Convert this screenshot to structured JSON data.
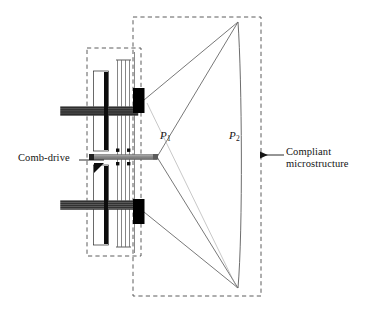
{
  "figure": {
    "background": "#ffffff",
    "width": 366,
    "height": 313
  },
  "labels": {
    "comb_drive": "Comb-drive",
    "compliant_line1": "Compliant",
    "compliant_line2": "microstructure",
    "point_p1": "P",
    "point_p1_sub": "1",
    "point_p2": "P",
    "point_p2_sub": "2"
  },
  "colors": {
    "line": "#1a1a1a",
    "thin_line": "#6a6a6a",
    "dashed_box": "#4d4d4d",
    "comb_dark": "#101010",
    "comb_teeth": "#5a5a5a",
    "anchor_block": "#000000",
    "shuttle_bar": "#8c8c8c",
    "beam": "#777777",
    "text": "#141414"
  },
  "regions": {
    "left_dashed_box": {
      "name": "comb-drive-region",
      "x": 87,
      "y": 48,
      "width": 54,
      "height": 208
    },
    "right_dashed_box": {
      "name": "compliant-microstructure-region",
      "x": 133,
      "y": 17,
      "width": 128,
      "height": 279
    }
  },
  "components": {
    "upper_comb": {
      "name": "upper-comb-drive",
      "x": 94,
      "y": 72,
      "width": 14,
      "height": 78
    },
    "lower_comb": {
      "name": "lower-comb-drive",
      "x": 94,
      "y": 166,
      "width": 14,
      "height": 78
    },
    "flexure_beams": {
      "name": "flexure-beam-group",
      "count": 4,
      "x": [
        117,
        121,
        125,
        129
      ],
      "top": 60,
      "bottom": 247
    },
    "shuttle_bar": {
      "name": "shuttle-bar",
      "x1": 92,
      "x2": 156,
      "y": 157,
      "thickness": 5
    },
    "upper_anchor": {
      "name": "upper-anchor-block",
      "x": 133,
      "y": 88,
      "width": 11,
      "height": 24
    },
    "lower_anchor": {
      "name": "lower-anchor-block",
      "x": 133,
      "y": 200,
      "width": 11,
      "height": 24
    },
    "apex_top": {
      "name": "apex-top-vertex",
      "x": 238,
      "y": 22
    },
    "apex_bottom": {
      "name": "apex-bottom-vertex",
      "x": 238,
      "y": 288
    },
    "node_p1": {
      "name": "node-p1",
      "x": 156,
      "y": 157
    },
    "node_p2": {
      "name": "node-p2",
      "x": 241,
      "y": 155
    }
  },
  "leaders": {
    "comb_drive_leader": {
      "name": "comb-drive-leader-line",
      "x1": 81,
      "y1": 160,
      "x2": 104,
      "y2": 160
    },
    "compliant_leader": {
      "name": "compliant-leader-arrow",
      "x1": 283,
      "y1": 155,
      "x2": 259,
      "y2": 155,
      "arrow": "left"
    }
  }
}
